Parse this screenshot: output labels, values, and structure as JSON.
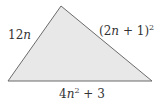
{
  "diagram": {
    "shape": "triangle",
    "fill": "#e8e8e8",
    "stroke": "#6b6b6b",
    "vertices": [
      [
        61,
        6
      ],
      [
        8,
        81
      ],
      [
        152,
        81
      ]
    ],
    "sides": {
      "left": {
        "coef": "12",
        "var": "n"
      },
      "right": {
        "open": "(2",
        "var": "n",
        "close": " + 1)",
        "exp": "2"
      },
      "bottom": {
        "coef": "4",
        "var": "n",
        "exp": "2",
        "rest": " + 3"
      }
    }
  }
}
